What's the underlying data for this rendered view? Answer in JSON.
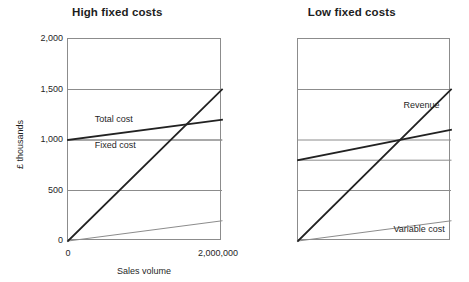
{
  "chart_data": [
    {
      "type": "line",
      "title": "High fixed costs",
      "xlabel": "Sales volume",
      "ylabel": "£ thousands",
      "xlim": [
        0,
        2000000
      ],
      "ylim": [
        0,
        2000
      ],
      "grid": true,
      "legend_position": "inline-annotations",
      "xticks": [
        "0",
        "2,000,000"
      ],
      "xtick_values": [
        0,
        2000000
      ],
      "yticks": [
        "0",
        "500",
        "1,000",
        "1,500",
        "2,000"
      ],
      "ytick_values": [
        0,
        500,
        1000,
        1500,
        2000
      ],
      "x": [
        0,
        2000000
      ],
      "series": [
        {
          "name": "Revenue",
          "values": [
            0,
            1500
          ],
          "color": "#222222",
          "width": 1.8,
          "label_x": 1150000,
          "label_y": 1330
        },
        {
          "name": "Total cost",
          "values": [
            1000,
            1200
          ],
          "color": "#222222",
          "width": 1.8,
          "label_x": 360000,
          "label_y": 1185
        },
        {
          "name": "Fixed cost",
          "values": [
            1000,
            1000
          ],
          "color": "#8c8c8c",
          "width": 1.0,
          "label_x": 360000,
          "label_y": 930
        },
        {
          "name": "Variable cost",
          "values": [
            0,
            200
          ],
          "color": "#8c8c8c",
          "width": 1.0,
          "label_x": 1180000,
          "label_y": 95
        }
      ],
      "breakeven": {
        "x": 1500000,
        "y": 1150
      }
    },
    {
      "type": "line",
      "title": "Low fixed costs",
      "xlabel": "Sales volume",
      "ylabel": "£ thousands",
      "xlim": [
        0,
        2000000
      ],
      "ylim": [
        0,
        2000
      ],
      "grid": true,
      "legend_position": "inline-annotations",
      "xticks": [
        "0",
        "2,000,000"
      ],
      "xtick_values": [
        0,
        2000000
      ],
      "yticks": [
        "0",
        "500",
        "1,000",
        "1,500",
        "2,000"
      ],
      "ytick_values": [
        0,
        500,
        1000,
        1500,
        2000
      ],
      "x": [
        0,
        2000000
      ],
      "series": [
        {
          "name": "Revenue",
          "values": [
            0,
            1500
          ],
          "color": "#222222",
          "width": 1.8,
          "label_x": 1110000,
          "label_y": 1330
        },
        {
          "name": "Total cost",
          "values": [
            800,
            1100
          ],
          "color": "#222222",
          "width": 1.8,
          "label_x": 160000,
          "label_y": 935
        },
        {
          "name": "Fixed cost",
          "values": [
            800,
            800
          ],
          "color": "#8c8c8c",
          "width": 1.0,
          "label_x": 300000,
          "label_y": 720
        },
        {
          "name": "Variable cost",
          "values": [
            0,
            200
          ],
          "color": "#8c8c8c",
          "width": 1.0,
          "label_x": 1180000,
          "label_y": 95
        }
      ],
      "breakeven": {
        "x": 1300000,
        "y": 1000
      }
    }
  ],
  "panels": [
    {
      "title": "High fixed costs"
    },
    {
      "title": "Low fixed costs"
    }
  ],
  "colors": {
    "frame": "#8c8c8c",
    "grid": "#8c8c8c",
    "dark_series": "#222222",
    "light_series": "#8c8c8c",
    "text": "#1f1f1f",
    "background": "#ffffff"
  }
}
